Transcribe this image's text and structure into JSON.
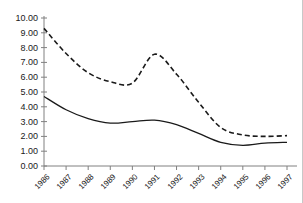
{
  "figure": {
    "title_fragment": "",
    "background_color": "#ffffff",
    "axis_color": "#808080",
    "line_color": "#1a1a1a"
  },
  "chart_data": {
    "type": "line",
    "title": "",
    "xlabel": "",
    "ylabel": "",
    "categories": [
      "1986",
      "1987",
      "1988",
      "1989",
      "1990",
      "1991",
      "1992",
      "1993",
      "1994",
      "1995",
      "1996",
      "1997"
    ],
    "x": [
      1986,
      1987,
      1988,
      1989,
      1990,
      1991,
      1992,
      1993,
      1994,
      1995,
      1996,
      1997
    ],
    "ylim": [
      0.0,
      10.0
    ],
    "yticks": [
      0.0,
      1.0,
      2.0,
      3.0,
      4.0,
      5.0,
      6.0,
      7.0,
      8.0,
      9.0,
      10.0
    ],
    "ytick_labels": [
      "0.00",
      "1.00",
      "2.00",
      "3.00",
      "4.00",
      "5.00",
      "6.00",
      "7.00",
      "8.00",
      "9.00",
      "10.00"
    ],
    "grid": false,
    "legend": "none",
    "series": [
      {
        "name": "dashed-series",
        "style": "dashed",
        "color": "#1a1a1a",
        "values": [
          9.3,
          7.6,
          6.3,
          5.7,
          5.6,
          7.55,
          6.2,
          4.3,
          2.6,
          2.1,
          2.0,
          2.05
        ]
      },
      {
        "name": "solid-series",
        "style": "solid",
        "color": "#1a1a1a",
        "values": [
          4.7,
          3.8,
          3.2,
          2.9,
          3.0,
          3.1,
          2.8,
          2.2,
          1.6,
          1.4,
          1.55,
          1.6
        ]
      }
    ]
  }
}
